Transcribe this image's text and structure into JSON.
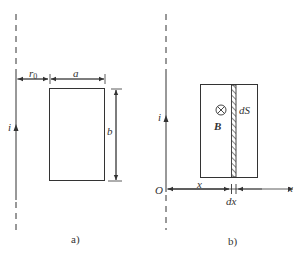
{
  "figure": {
    "panel_a": {
      "caption": "a)",
      "current_label": "i",
      "distance_label": "r",
      "distance_subscript": "0",
      "width_label": "a",
      "height_label": "b"
    },
    "panel_b": {
      "caption": "b)",
      "current_label": "i",
      "field_symbol": "⊗",
      "field_label": "B",
      "strip_label": "dS",
      "origin_label": "O",
      "x_label": "x",
      "axis_label": "x",
      "dx_label": "dx"
    },
    "colors": {
      "line": "#333333",
      "background": "#ffffff"
    }
  }
}
